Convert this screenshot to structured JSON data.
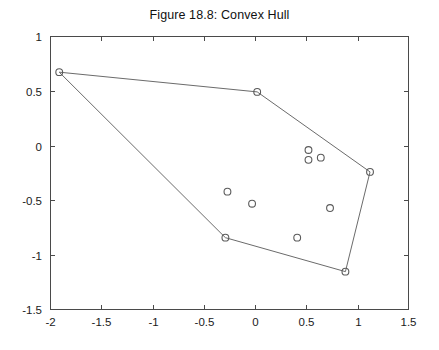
{
  "figure": {
    "title": "Figure 18.8: Convex Hull",
    "background_color": "#ffffff",
    "axis_color": "#4a4a4a",
    "marker_color": "#5a5a5a",
    "hull_color": "#6b6b6b"
  },
  "chart_data": {
    "type": "scatter",
    "title": "Figure 18.8: Convex Hull",
    "xlabel": "",
    "ylabel": "",
    "xlim": [
      -2,
      1.5
    ],
    "ylim": [
      -1.5,
      1
    ],
    "xticks": [
      -2,
      -1.5,
      -1,
      -0.5,
      0,
      0.5,
      1,
      1.5
    ],
    "xtick_labels": [
      "-2",
      "-1.5",
      "-1",
      "-0.5",
      "0",
      "0.5",
      "1",
      "1.5"
    ],
    "yticks": [
      -1.5,
      -1,
      -0.5,
      0,
      0.5,
      1
    ],
    "ytick_labels": [
      "-1.5",
      "-1",
      "-0.5",
      "0",
      "0.5",
      "1"
    ],
    "grid": false,
    "legend": null,
    "marker": "circle-open",
    "series": [
      {
        "name": "points",
        "points": [
          {
            "x": -1.91,
            "y": 0.67,
            "hull": true
          },
          {
            "x": 0.02,
            "y": 0.49,
            "hull": true
          },
          {
            "x": 1.12,
            "y": -0.24,
            "hull": true
          },
          {
            "x": 0.88,
            "y": -1.15,
            "hull": true
          },
          {
            "x": -0.29,
            "y": -0.84,
            "hull": true
          },
          {
            "x": 0.52,
            "y": -0.04,
            "hull": false
          },
          {
            "x": 0.52,
            "y": -0.13,
            "hull": false
          },
          {
            "x": 0.64,
            "y": -0.11,
            "hull": false
          },
          {
            "x": 0.73,
            "y": -0.57,
            "hull": false
          },
          {
            "x": 0.41,
            "y": -0.84,
            "hull": false
          },
          {
            "x": -0.27,
            "y": -0.42,
            "hull": false
          },
          {
            "x": -0.03,
            "y": -0.53,
            "hull": false
          }
        ]
      }
    ],
    "hull_vertices": [
      {
        "x": -1.91,
        "y": 0.67
      },
      {
        "x": 0.02,
        "y": 0.49
      },
      {
        "x": 1.12,
        "y": -0.24
      },
      {
        "x": 0.88,
        "y": -1.15
      },
      {
        "x": -0.29,
        "y": -0.84
      }
    ]
  }
}
